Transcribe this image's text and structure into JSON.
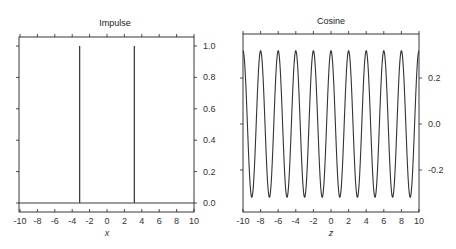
{
  "chart_data": [
    {
      "type": "line",
      "title": "Impulse",
      "xlabel": "x",
      "ylabel": "",
      "xlim": [
        -10,
        10
      ],
      "ylim": [
        -0.05,
        1.05
      ],
      "xticks": [
        "-10",
        "-8",
        "-6",
        "-4",
        "-2",
        "0",
        "2",
        "4",
        "6",
        "8",
        "10"
      ],
      "yticks": [
        "0.0",
        "0.2",
        "0.4",
        "0.6",
        "0.8",
        "1.0"
      ],
      "y_axis_side": "right",
      "grid": false,
      "series": [
        {
          "name": "impulse",
          "description": "Two unit impulses at x = -pi and x = pi on a zero baseline",
          "x": [
            -10,
            -3.1416,
            -3.1416,
            -3.1416,
            3.1416,
            3.1416,
            3.1416,
            10
          ],
          "y": [
            0,
            0,
            1.0,
            0,
            0,
            1.0,
            0,
            0
          ]
        }
      ]
    },
    {
      "type": "line",
      "title": "Cosine",
      "xlabel": "z",
      "ylabel": "",
      "xlim": [
        -10,
        10
      ],
      "ylim": [
        -0.37,
        0.37
      ],
      "xticks": [
        "-10",
        "-8",
        "-6",
        "-4",
        "-2",
        "0",
        "2",
        "4",
        "6",
        "8",
        "10"
      ],
      "yticks": [
        "-0.2",
        "0.0",
        "0.2"
      ],
      "y_axis_side": "right",
      "grid": false,
      "series": [
        {
          "name": "cosine",
          "description": "y = (1/pi) * cos(pi * z), peaks at even z, troughs at odd z",
          "amplitude": 0.318,
          "period": 2,
          "peaks_x": [
            -10,
            -8,
            -6,
            -4,
            -2,
            0,
            2,
            4,
            6,
            8,
            10
          ],
          "troughs_x": [
            -9,
            -7,
            -5,
            -3,
            -1,
            1,
            3,
            5,
            7,
            9
          ]
        }
      ]
    }
  ]
}
